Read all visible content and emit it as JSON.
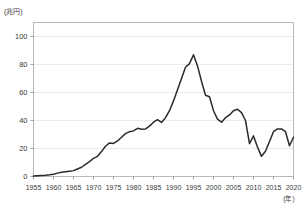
{
  "chart_data": {
    "type": "line",
    "title": "",
    "subtitle": "",
    "ylabel": "(兆円)",
    "xlabel": "(年)",
    "ylim": [
      0,
      110
    ],
    "xlim": [
      1955,
      2020
    ],
    "grid": true,
    "legend": null,
    "legend_position": "none",
    "yticks": [
      0,
      20,
      40,
      60,
      80,
      100
    ],
    "ytick_labels": [
      "0",
      "20",
      "40",
      "60",
      "80",
      "100"
    ],
    "xticks": [
      1955,
      1960,
      1965,
      1970,
      1975,
      1980,
      1985,
      1990,
      1995,
      2000,
      2005,
      2010,
      2015,
      2020
    ],
    "xtick_labels": [
      "1955",
      "1960",
      "1965",
      "1970",
      "1975",
      "1980",
      "1985",
      "1990",
      "1995",
      "2000",
      "2005",
      "2010",
      "2015",
      "2020"
    ],
    "line_color": "#2b2b2b",
    "series": [
      {
        "name": "value",
        "x": [
          1955,
          1956,
          1957,
          1958,
          1959,
          1960,
          1961,
          1962,
          1963,
          1964,
          1965,
          1966,
          1967,
          1968,
          1969,
          1970,
          1971,
          1972,
          1973,
          1974,
          1975,
          1976,
          1977,
          1978,
          1979,
          1980,
          1981,
          1982,
          1983,
          1984,
          1985,
          1986,
          1987,
          1988,
          1989,
          1990,
          1991,
          1992,
          1993,
          1994,
          1995,
          1996,
          1997,
          1998,
          1999,
          2000,
          2001,
          2002,
          2003,
          2004,
          2005,
          2006,
          2007,
          2008,
          2009,
          2010,
          2011,
          2012,
          2013,
          2014,
          2015,
          2016,
          2017,
          2018,
          2019,
          2020
        ],
        "values": [
          0.4,
          0.6,
          0.8,
          0.9,
          1.2,
          1.6,
          2.4,
          3.0,
          3.4,
          3.8,
          4.2,
          5.4,
          6.6,
          8.6,
          10.6,
          13.0,
          14.4,
          17.8,
          21.6,
          24.0,
          23.6,
          25.4,
          28.0,
          30.6,
          32.0,
          32.6,
          34.4,
          33.8,
          34.0,
          36.0,
          38.8,
          40.6,
          38.6,
          42.0,
          47.0,
          54.0,
          62.0,
          70.0,
          78.0,
          80.6,
          87.0,
          79.0,
          68.0,
          58.0,
          57.0,
          47.0,
          41.0,
          38.8,
          42.0,
          44.0,
          47.0,
          48.0,
          45.6,
          40.0,
          23.4,
          29.0,
          21.0,
          14.4,
          18.0,
          25.0,
          32.0,
          34.0,
          34.0,
          32.0,
          22.0,
          28.0
        ]
      }
    ]
  }
}
